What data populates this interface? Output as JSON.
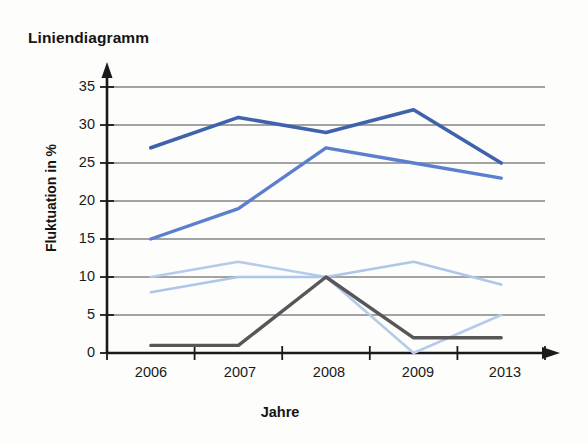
{
  "chart_data": {
    "type": "line",
    "title": "Liniendiagramm",
    "xlabel": "Jahre",
    "ylabel": "Fluktuation in %",
    "categories": [
      "2006",
      "2007",
      "2008",
      "2009",
      "2013"
    ],
    "ylim": [
      0,
      35
    ],
    "ytick_labels": [
      "0",
      "5",
      "10",
      "15",
      "20",
      "25",
      "30",
      "35"
    ],
    "ytick_values": [
      0,
      5,
      10,
      15,
      20,
      25,
      30,
      35
    ],
    "grid": true,
    "legend": "none",
    "series": [
      {
        "name": "series-dark-blue",
        "color": "#3f62ab",
        "values": [
          27,
          31,
          29,
          32,
          25
        ]
      },
      {
        "name": "series-medium-blue",
        "color": "#5b7fce",
        "values": [
          15,
          19,
          27,
          25,
          23
        ]
      },
      {
        "name": "series-light-blue-a",
        "color": "#b6cbea",
        "values": [
          10,
          12,
          10,
          0,
          5
        ]
      },
      {
        "name": "series-light-blue-b",
        "color": "#aec6e8",
        "values": [
          8,
          10,
          10,
          12,
          9
        ]
      },
      {
        "name": "series-gray",
        "color": "#575757",
        "values": [
          1,
          1,
          10,
          2,
          2
        ]
      }
    ]
  },
  "axes": {
    "y_axis_color": "#1a1a1a",
    "x_axis_color": "#1a1a1a",
    "gridline_color": "#4a4a4a"
  }
}
